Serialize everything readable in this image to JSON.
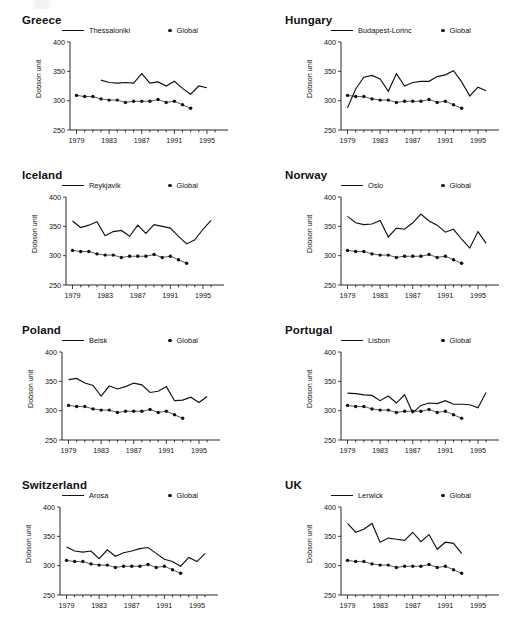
{
  "figure": {
    "panel_count": 8,
    "axis": {
      "ylabel": "Dobson unit",
      "yticks": [
        250,
        300,
        350,
        400
      ],
      "ylim": [
        250,
        400
      ],
      "xticks": [
        1979,
        1983,
        1987,
        1991,
        1995
      ],
      "xlim": [
        1978.2,
        1996.6
      ],
      "xminor_step": 1,
      "grid": false
    },
    "legend": {
      "global_label": "Global",
      "position": "above-plot"
    },
    "line_color": "#111111",
    "dot_color": "#111111"
  },
  "chart_data": [
    {
      "type": "line",
      "title": "Greece",
      "xlabel": "",
      "ylabel": "Dobson unit",
      "ylim": [
        250,
        400
      ],
      "xlim": [
        1978.2,
        1996.6
      ],
      "legend": [
        "Thessaloniki",
        "Global"
      ],
      "x": [
        1979,
        1980,
        1981,
        1982,
        1983,
        1984,
        1985,
        1986,
        1987,
        1988,
        1989,
        1990,
        1991,
        1992,
        1993,
        1994,
        1995
      ],
      "series": [
        {
          "name": "Thessaloniki",
          "style": "line",
          "x": [
            1982,
            1983,
            1984,
            1985,
            1986,
            1987,
            1988,
            1989,
            1990,
            1991,
            1992,
            1993,
            1994,
            1995
          ],
          "values": [
            335,
            331,
            330,
            331,
            330,
            346,
            330,
            332,
            325,
            333,
            321,
            311,
            325,
            322,
            334
          ]
        },
        {
          "name": "Global",
          "style": "dots",
          "x": [
            1979,
            1980,
            1981,
            1982,
            1983,
            1984,
            1985,
            1986,
            1987,
            1988,
            1989,
            1990,
            1991,
            1992,
            1993
          ],
          "values": [
            309,
            307,
            307,
            303,
            301,
            301,
            297,
            299,
            299,
            299,
            302,
            297,
            299,
            293,
            287
          ]
        }
      ]
    },
    {
      "type": "line",
      "title": "Hungary",
      "xlabel": "",
      "ylabel": "Dobson unit",
      "ylim": [
        250,
        400
      ],
      "xlim": [
        1978.2,
        1996.6
      ],
      "legend": [
        "Budapest-Lorinc",
        "Global"
      ],
      "series": [
        {
          "name": "Budapest-Lorinc",
          "style": "line",
          "x": [
            1979,
            1980,
            1981,
            1982,
            1983,
            1984,
            1985,
            1986,
            1987,
            1988,
            1989,
            1990,
            1991,
            1992,
            1993,
            1994,
            1995,
            1996
          ],
          "values": [
            288,
            320,
            340,
            343,
            337,
            316,
            346,
            325,
            331,
            333,
            333,
            341,
            344,
            351,
            332,
            308,
            323,
            317,
            318
          ]
        },
        {
          "name": "Global",
          "style": "dots",
          "x": [
            1979,
            1980,
            1981,
            1982,
            1983,
            1984,
            1985,
            1986,
            1987,
            1988,
            1989,
            1990,
            1991,
            1992,
            1993
          ],
          "values": [
            309,
            307,
            307,
            303,
            301,
            301,
            297,
            299,
            299,
            299,
            302,
            297,
            299,
            293,
            287
          ]
        }
      ]
    },
    {
      "type": "line",
      "title": "Iceland",
      "xlabel": "",
      "ylabel": "Dobson unit",
      "ylim": [
        250,
        400
      ],
      "xlim": [
        1978.2,
        1996.6
      ],
      "legend": [
        "Reykjavik",
        "Global"
      ],
      "series": [
        {
          "name": "Reykjavik",
          "style": "line",
          "x": [
            1979,
            1980,
            1981,
            1982,
            1983,
            1984,
            1985,
            1986,
            1987,
            1988,
            1989,
            1990,
            1991,
            1992,
            1993,
            1994,
            1995,
            1996
          ],
          "values": [
            359,
            348,
            352,
            358,
            334,
            341,
            343,
            333,
            352,
            338,
            353,
            350,
            347,
            333,
            320,
            327,
            345,
            360
          ]
        },
        {
          "name": "Global",
          "style": "dots",
          "x": [
            1979,
            1980,
            1981,
            1982,
            1983,
            1984,
            1985,
            1986,
            1987,
            1988,
            1989,
            1990,
            1991,
            1992,
            1993
          ],
          "values": [
            309,
            307,
            307,
            303,
            301,
            301,
            297,
            299,
            299,
            299,
            302,
            297,
            299,
            293,
            287
          ]
        }
      ]
    },
    {
      "type": "line",
      "title": "Norway",
      "xlabel": "",
      "ylabel": "Dobson unit",
      "ylim": [
        250,
        400
      ],
      "xlim": [
        1978.2,
        1996.6
      ],
      "legend": [
        "Oslo",
        "Global"
      ],
      "series": [
        {
          "name": "Oslo",
          "style": "line",
          "x": [
            1979,
            1980,
            1981,
            1982,
            1983,
            1984,
            1985,
            1986,
            1987,
            1988,
            1989,
            1990,
            1991,
            1992,
            1993,
            1994,
            1995,
            1996
          ],
          "values": [
            367,
            356,
            353,
            354,
            360,
            332,
            347,
            345,
            356,
            371,
            359,
            352,
            340,
            345,
            328,
            313,
            341,
            321,
            312
          ]
        },
        {
          "name": "Global",
          "style": "dots",
          "x": [
            1979,
            1980,
            1981,
            1982,
            1983,
            1984,
            1985,
            1986,
            1987,
            1988,
            1989,
            1990,
            1991,
            1992,
            1993
          ],
          "values": [
            309,
            307,
            307,
            303,
            301,
            301,
            297,
            299,
            299,
            299,
            302,
            297,
            299,
            293,
            287
          ]
        }
      ]
    },
    {
      "type": "line",
      "title": "Poland",
      "xlabel": "",
      "ylabel": "Dobson unit",
      "ylim": [
        250,
        400
      ],
      "xlim": [
        1978.2,
        1996.6
      ],
      "legend": [
        "Belsk",
        "Global"
      ],
      "series": [
        {
          "name": "Belsk",
          "style": "line",
          "x": [
            1979,
            1980,
            1981,
            1982,
            1983,
            1984,
            1985,
            1986,
            1987,
            1988,
            1989,
            1990,
            1991,
            1992,
            1993,
            1994,
            1995,
            1996
          ],
          "values": [
            353,
            355,
            347,
            343,
            325,
            342,
            337,
            341,
            347,
            344,
            331,
            333,
            341,
            317,
            318,
            323,
            314,
            324
          ]
        },
        {
          "name": "Global",
          "style": "dots",
          "x": [
            1979,
            1980,
            1981,
            1982,
            1983,
            1984,
            1985,
            1986,
            1987,
            1988,
            1989,
            1990,
            1991,
            1992,
            1993
          ],
          "values": [
            309,
            307,
            307,
            303,
            301,
            301,
            297,
            299,
            299,
            299,
            302,
            297,
            299,
            293,
            287
          ]
        }
      ]
    },
    {
      "type": "line",
      "title": "Portugal",
      "xlabel": "",
      "ylabel": "Dobson unit",
      "ylim": [
        250,
        400
      ],
      "xlim": [
        1978.2,
        1996.6
      ],
      "legend": [
        "Lisbon",
        "Global"
      ],
      "series": [
        {
          "name": "Lisbon",
          "style": "line",
          "x": [
            1979,
            1980,
            1981,
            1982,
            1983,
            1984,
            1985,
            1986,
            1987,
            1988,
            1989,
            1990,
            1991,
            1992,
            1993,
            1994,
            1995,
            1996
          ],
          "values": [
            330,
            329,
            327,
            326,
            317,
            325,
            313,
            327,
            296,
            309,
            313,
            312,
            317,
            311,
            311,
            310,
            305,
            331
          ]
        },
        {
          "name": "Global",
          "style": "dots",
          "x": [
            1979,
            1980,
            1981,
            1982,
            1983,
            1984,
            1985,
            1986,
            1987,
            1988,
            1989,
            1990,
            1991,
            1992,
            1993
          ],
          "values": [
            309,
            307,
            307,
            303,
            301,
            301,
            297,
            299,
            299,
            299,
            302,
            297,
            299,
            293,
            287
          ]
        }
      ]
    },
    {
      "type": "line",
      "title": "Switzerland",
      "xlabel": "",
      "ylabel": "Dobson unit",
      "ylim": [
        250,
        400
      ],
      "xlim": [
        1978.2,
        1996.6
      ],
      "legend": [
        "Arosa",
        "Global"
      ],
      "series": [
        {
          "name": "Arosa",
          "style": "line",
          "x": [
            1979,
            1980,
            1981,
            1982,
            1983,
            1984,
            1985,
            1986,
            1987,
            1988,
            1989,
            1990,
            1991,
            1992,
            1993,
            1994,
            1995,
            1996
          ],
          "values": [
            332,
            325,
            323,
            325,
            312,
            327,
            316,
            322,
            325,
            329,
            331,
            321,
            311,
            307,
            299,
            314,
            307,
            321
          ]
        },
        {
          "name": "Global",
          "style": "dots",
          "x": [
            1979,
            1980,
            1981,
            1982,
            1983,
            1984,
            1985,
            1986,
            1987,
            1988,
            1989,
            1990,
            1991,
            1992,
            1993
          ],
          "values": [
            309,
            307,
            307,
            303,
            301,
            301,
            297,
            299,
            299,
            299,
            302,
            297,
            299,
            293,
            287
          ]
        }
      ]
    },
    {
      "type": "line",
      "title": "UK",
      "xlabel": "",
      "ylabel": "Dobson unit",
      "ylim": [
        250,
        400
      ],
      "xlim": [
        1978.2,
        1996.6
      ],
      "legend": [
        "Lerwick",
        "Global"
      ],
      "series": [
        {
          "name": "Lerwick",
          "style": "line",
          "x": [
            1979,
            1980,
            1981,
            1982,
            1983,
            1984,
            1985,
            1986,
            1987,
            1988,
            1989,
            1990,
            1991,
            1992,
            1993
          ],
          "values": [
            372,
            357,
            362,
            372,
            340,
            347,
            345,
            343,
            357,
            341,
            353,
            328,
            340,
            338,
            321
          ]
        },
        {
          "name": "Global",
          "style": "dots",
          "x": [
            1979,
            1980,
            1981,
            1982,
            1983,
            1984,
            1985,
            1986,
            1987,
            1988,
            1989,
            1990,
            1991,
            1992,
            1993
          ],
          "values": [
            309,
            307,
            307,
            303,
            301,
            301,
            297,
            299,
            299,
            299,
            302,
            297,
            299,
            293,
            287
          ]
        }
      ]
    }
  ]
}
